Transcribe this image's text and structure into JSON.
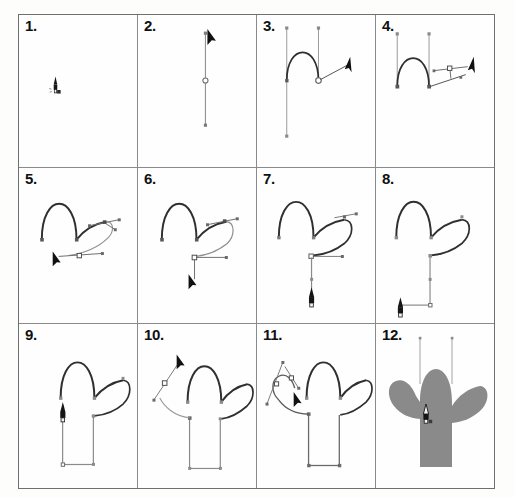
{
  "page": {
    "background_color": "#fdfdfc",
    "grid": {
      "columns": 4,
      "rows": 3,
      "border_color": "#6f6f6f",
      "divider_color": "#8a8a8a"
    }
  },
  "palette": {
    "stroke": "#2a2a2a",
    "path_guide": "#6a6a6a",
    "handle_line": "#8c8c8c",
    "anchor_fill": "#777777",
    "cursor": "#111111",
    "cactus_fill": "#8a8a8a"
  },
  "steps": [
    {
      "number": "1.",
      "label": "place-pen-tool",
      "description": "Pen tool cursor positioned on empty canvas",
      "elements": [
        "pen-tool-cursor"
      ]
    },
    {
      "number": "2.",
      "label": "first-vertical-segment",
      "description": "First straight vertical segment drawn with one anchor point and an open endpoint",
      "elements": [
        "vertical-line",
        "anchor-point",
        "open-anchor",
        "arrow-cursor"
      ]
    },
    {
      "number": "3.",
      "label": "first-arch",
      "description": "Arch curve completed between the two verticals; direction handles visible",
      "elements": [
        "arch-curve",
        "two-verticals",
        "handle-points",
        "arrow-cursor"
      ]
    },
    {
      "number": "4.",
      "label": "drag-right-handle",
      "description": "Dragging a new handle out to the right to begin the arm",
      "elements": [
        "arch-curve",
        "handle-bar",
        "square-handle",
        "arrow-cursor"
      ]
    },
    {
      "number": "5.",
      "label": "arm-underside-curve",
      "description": "Underside of the right arm curved in; handle bar pulled left-down",
      "elements": [
        "arch-curve",
        "arm-curve",
        "handle-bar",
        "square-handle",
        "arrow-cursor"
      ]
    },
    {
      "number": "6.",
      "label": "arm-closed",
      "description": "Arm loop closed back toward the body; handle dragged downward",
      "elements": [
        "arch-curve",
        "arm-loop",
        "handle-bar",
        "arrow-cursor"
      ]
    },
    {
      "number": "7.",
      "label": "body-vertical-down",
      "description": "Right body edge drawn straight down; pen cursor at the bottom",
      "elements": [
        "cactus-upper",
        "body-right-edge",
        "pen-tool-cursor"
      ]
    },
    {
      "number": "8.",
      "label": "bottom-edge",
      "description": "Bottom edge drawn across to the left",
      "elements": [
        "cactus-upper",
        "body-right-edge",
        "bottom-edge",
        "pen-tool-cursor"
      ]
    },
    {
      "number": "9.",
      "label": "left-body-edge",
      "description": "Left body edge drawn back up to the head",
      "elements": [
        "cactus-outline",
        "pen-tool-cursor"
      ]
    },
    {
      "number": "10.",
      "label": "left-arm-start",
      "description": "Starting the left arm — dragging a direction handle up-left",
      "elements": [
        "cactus-outline",
        "handle-bar",
        "square-handle",
        "arrow-cursor"
      ]
    },
    {
      "number": "11.",
      "label": "left-arm-shaping",
      "description": "Shaping the left arm with two handle bars",
      "elements": [
        "cactus-outline",
        "left-arm-curves",
        "handle-bars",
        "arrow-cursor"
      ]
    },
    {
      "number": "12.",
      "label": "filled-shape",
      "description": "Closed path filled with flat gray",
      "elements": [
        "cactus-filled",
        "remaining-guides",
        "pen-tool-cursor"
      ]
    }
  ]
}
